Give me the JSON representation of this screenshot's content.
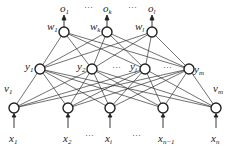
{
  "diagram": {
    "type": "three-layer neural network",
    "output_layer": {
      "nodes": [
        {
          "x": 64,
          "label": "o",
          "sub": "1"
        },
        {
          "x": 107,
          "label": "o",
          "sub": "k"
        },
        {
          "x": 152,
          "label": "o",
          "sub": "l"
        }
      ],
      "weights": [
        {
          "label": "w",
          "sub": "1"
        },
        {
          "label": "w",
          "sub": "k"
        },
        {
          "label": "w",
          "sub": "l"
        }
      ],
      "ellipsis": "···"
    },
    "hidden_layer": {
      "nodes": [
        {
          "x": 40,
          "label": "y",
          "sub": "1"
        },
        {
          "x": 92,
          "label": "y",
          "sub": "2"
        },
        {
          "x": 145,
          "label": "y",
          "sub": "j"
        },
        {
          "x": 189,
          "label": "y",
          "sub": "m"
        }
      ],
      "ellipsis": "···"
    },
    "input_layer": {
      "nodes": [
        {
          "x": 14,
          "label": "x",
          "sub": "1"
        },
        {
          "x": 68,
          "label": "x",
          "sub": "2"
        },
        {
          "x": 110,
          "label": "x",
          "sub": "i"
        },
        {
          "x": 163,
          "label": "x",
          "sub": "n−1"
        },
        {
          "x": 216,
          "label": "x",
          "sub": "n"
        }
      ],
      "weights": [
        {
          "label": "v",
          "sub": "1"
        },
        {
          "label": "v",
          "sub": "m"
        }
      ],
      "ellipsis": "···"
    }
  }
}
